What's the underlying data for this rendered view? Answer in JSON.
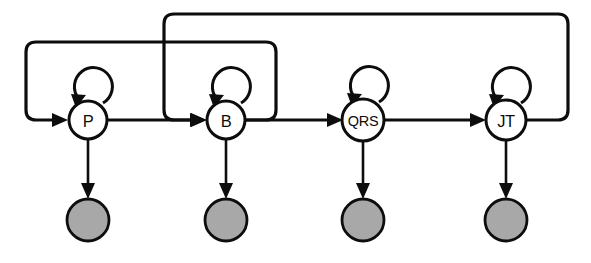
{
  "diagram": {
    "type": "hmm-state-diagram",
    "canvas": {
      "width": 591,
      "height": 263,
      "background": "#ffffff"
    },
    "colors": {
      "stroke": "#0d0d0d",
      "state_fill": "#ffffff",
      "observation_fill": "#a8a8a8"
    },
    "states": [
      {
        "id": "P",
        "label": "P",
        "cx": 88,
        "cy": 120,
        "r": 19,
        "font": "normal"
      },
      {
        "id": "B",
        "label": "B",
        "cx": 226,
        "cy": 120,
        "r": 19,
        "font": "normal"
      },
      {
        "id": "QRS",
        "label": "QRS",
        "cx": 363,
        "cy": 120,
        "r": 21,
        "font": "small"
      },
      {
        "id": "JT",
        "label": "JT",
        "cx": 506,
        "cy": 120,
        "r": 20,
        "font": "normal"
      }
    ],
    "observations": [
      {
        "id": "obs-P",
        "label": "",
        "cx": 88,
        "cy": 220,
        "r": 21
      },
      {
        "id": "obs-B",
        "label": "",
        "cx": 226,
        "cy": 220,
        "r": 21
      },
      {
        "id": "obs-QRS",
        "label": "",
        "cx": 363,
        "cy": 220,
        "r": 21
      },
      {
        "id": "obs-JT",
        "label": "",
        "cx": 506,
        "cy": 220,
        "r": 21
      }
    ],
    "transitions": [
      {
        "id": "p-to-b",
        "from": "P",
        "to": "B",
        "kind": "forward"
      },
      {
        "id": "b-to-qrs",
        "from": "B",
        "to": "QRS",
        "kind": "forward"
      },
      {
        "id": "qrs-to-jt",
        "from": "QRS",
        "to": "JT",
        "kind": "forward"
      }
    ],
    "self_transitions": [
      {
        "id": "p-self",
        "state": "P"
      },
      {
        "id": "b-self",
        "state": "B"
      },
      {
        "id": "qrs-self",
        "state": "QRS"
      },
      {
        "id": "jt-self",
        "state": "JT"
      }
    ],
    "feedback_loops": [
      {
        "id": "b-to-p-loop",
        "from": "B",
        "to": "P",
        "top_y": 42,
        "left_x": 26,
        "right_x": 276
      },
      {
        "id": "jt-to-b-loop",
        "from": "JT",
        "to": "B",
        "top_y": 14,
        "left_x": 164,
        "right_x": 568
      }
    ],
    "emissions": [
      {
        "id": "emit-p",
        "from": "P",
        "to": "obs-P"
      },
      {
        "id": "emit-b",
        "from": "B",
        "to": "obs-B"
      },
      {
        "id": "emit-qrs",
        "from": "QRS",
        "to": "obs-QRS"
      },
      {
        "id": "emit-jt",
        "from": "JT",
        "to": "obs-JT"
      }
    ]
  }
}
